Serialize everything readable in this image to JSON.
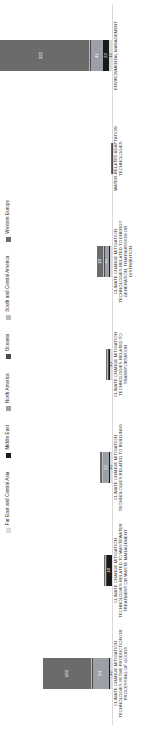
{
  "chart_data": {
    "type": "bar",
    "subtype": "stacked-bar",
    "title": "",
    "xlabel": "",
    "ylabel": "",
    "ylim": [
      0,
      330
    ],
    "grid": false,
    "legend_position": "top",
    "orientation": "vertical-bars-rotated-canvas",
    "categories": [
      "CLIMATE CHANGE MITIGATION TECHNOLOGIES IN THE PRODUCTION OR PROCESSING OF GOODS",
      "CLIMATE CHANGE MITIGATION TECHNOLOGIES RELATED TO WASTEWATER TREATMENT OR WASTE MANAGEMENT",
      "CLIMATE CHANGE MITIGATION TECHNOLOGIES RELATED TO BUILDINGS",
      "CLIMATE CHANGE MITIGATION TECHNOLOGIES RELATED TO TRANSPORTATION",
      "CLIMATE CHANGE MITIGATION TECHNOLOGIES RELATED TO ENERGY GENERATION, TRANSMISSION OR DISTRIBUTION",
      "WATER-RELATED ADAPTATION TECHNOLOGIES",
      "ENVIRONMENTAL MANAGEMENT"
    ],
    "series": [
      {
        "name": "Far East and Central Asia",
        "color": "#d9dde0",
        "values": [
          12,
          3,
          10,
          13,
          10,
          1,
          12
        ]
      },
      {
        "name": "Middle East",
        "color": "#1a1a1a",
        "values": [
          3,
          18,
          2,
          1,
          4,
          1,
          22
        ]
      },
      {
        "name": "North America",
        "color": "#9aa0a6",
        "values": [
          54,
          3,
          22,
          3,
          16,
          2,
          41
        ]
      },
      {
        "name": "Oceania",
        "color": "#4a4a4a",
        "values": [
          2,
          1,
          2,
          1,
          2,
          1,
          3
        ]
      },
      {
        "name": "South and Central America",
        "color": "#b8bcc0",
        "values": [
          4,
          1,
          2,
          1,
          3,
          1,
          5
        ]
      },
      {
        "name": "Western Europe",
        "color": "#6b6b6b",
        "values": [
          162,
          6,
          7,
          4,
          18,
          1,
          322
        ]
      }
    ],
    "visible_value_labels": {
      "CLIMATE CHANGE MITIGATION TECHNOLOGIES IN THE PRODUCTION OR PROCESSING OF GOODS": [
        "12",
        "54",
        "162"
      ],
      "CLIMATE CHANGE MITIGATION TECHNOLOGIES RELATED TO WASTEWATER TREATMENT OR WASTE MANAGEMENT": [
        "18"
      ],
      "CLIMATE CHANGE MITIGATION TECHNOLOGIES RELATED TO BUILDINGS": [
        "10",
        "22"
      ],
      "CLIMATE CHANGE MITIGATION TECHNOLOGIES RELATED TO TRANSPORTATION": [
        "13"
      ],
      "CLIMATE CHANGE MITIGATION TECHNOLOGIES RELATED TO ENERGY GENERATION, TRANSMISSION OR DISTRIBUTION": [
        "16",
        "18"
      ],
      "WATER-RELATED ADAPTATION TECHNOLOGIES": [],
      "ENVIRONMENTAL MANAGEMENT": [
        "12",
        "22",
        "41",
        "322"
      ]
    }
  },
  "legend": {
    "items": [
      {
        "label": "Far East and Central Asia",
        "color": "#d9dde0"
      },
      {
        "label": "Middle East",
        "color": "#1a1a1a"
      },
      {
        "label": "North America",
        "color": "#9aa0a6"
      },
      {
        "label": "Oceania",
        "color": "#4a4a4a"
      },
      {
        "label": "South and Central America",
        "color": "#b8bcc0"
      },
      {
        "label": "Western Europe",
        "color": "#6b6b6b"
      }
    ]
  }
}
